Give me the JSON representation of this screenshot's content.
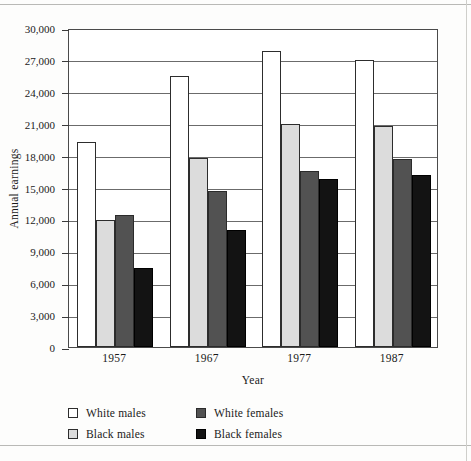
{
  "chart_data": {
    "type": "bar",
    "title": "",
    "xlabel": "Year",
    "ylabel": "Annual earnings",
    "categories": [
      "1957",
      "1967",
      "1977",
      "1987"
    ],
    "ylim": [
      0,
      30000
    ],
    "ytick_step": 3000,
    "ytick_labels": [
      "0",
      "3,000",
      "6,000",
      "9,000",
      "12,000",
      "15,000",
      "18,000",
      "21,000",
      "24,000",
      "27,000",
      "30,000"
    ],
    "grid": true,
    "legend_position": "bottom-left",
    "series": [
      {
        "name": "White males",
        "key": "white-males",
        "color": "#ffffff",
        "values": [
          19300,
          25500,
          27800,
          27000
        ]
      },
      {
        "name": "Black males",
        "key": "black-males",
        "color": "#dcdcdc",
        "values": [
          11900,
          17800,
          21000,
          20800
        ]
      },
      {
        "name": "White females",
        "key": "white-females",
        "color": "#525252",
        "values": [
          12400,
          14700,
          16600,
          17700
        ]
      },
      {
        "name": "Black females",
        "key": "black-females",
        "color": "#131313",
        "values": [
          7400,
          11000,
          15800,
          16200
        ]
      }
    ]
  }
}
